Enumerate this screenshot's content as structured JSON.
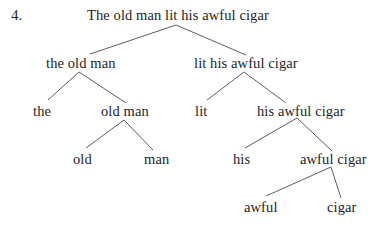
{
  "example_number": "4.",
  "tree": {
    "root": {
      "label": "The old man lit his awful cigar",
      "left": {
        "label": "the old man",
        "left": {
          "label": "the"
        },
        "right": {
          "label": "old man",
          "left": {
            "label": "old"
          },
          "right": {
            "label": "man"
          }
        }
      },
      "right": {
        "label": "lit his awful cigar",
        "left": {
          "label": "lit"
        },
        "right": {
          "label": "his awful cigar",
          "left": {
            "label": "his"
          },
          "right": {
            "label": "awful cigar",
            "left": {
              "label": "awful"
            },
            "right": {
              "label": "cigar"
            }
          }
        }
      }
    }
  },
  "colors": {
    "text": "#1e1e1e",
    "edges": "#4a4a4a",
    "background": "#ffffff"
  }
}
